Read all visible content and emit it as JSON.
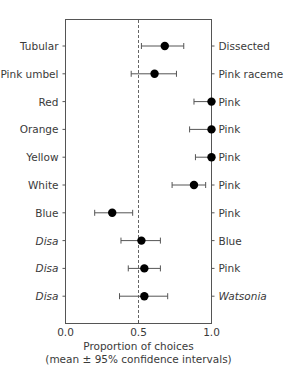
{
  "chart_data": {
    "type": "scatter",
    "subtype": "dot-plot-with-error-bars",
    "title": "",
    "xlabel": "Proportion of choices",
    "xlabel_sub": "(mean ± 95% confidence intervals)",
    "xlim": [
      0.0,
      1.0
    ],
    "xticks": [
      "0.0",
      "0.5",
      "1.0"
    ],
    "reference_line": {
      "x": 0.5,
      "style": "dashed"
    },
    "grid": false,
    "rows": [
      {
        "left": "Tubular",
        "left_italic": false,
        "right": "Dissected",
        "right_italic": false,
        "mean": 0.68,
        "ci_low": 0.52,
        "ci_high": 0.81
      },
      {
        "left": "Pink umbel",
        "left_italic": false,
        "right": "Pink raceme",
        "right_italic": false,
        "mean": 0.61,
        "ci_low": 0.45,
        "ci_high": 0.76
      },
      {
        "left": "Red",
        "left_italic": false,
        "right": "Pink",
        "right_italic": false,
        "mean": 1.0,
        "ci_low": 0.88,
        "ci_high": 1.0
      },
      {
        "left": "Orange",
        "left_italic": false,
        "right": "Pink",
        "right_italic": false,
        "mean": 1.0,
        "ci_low": 0.85,
        "ci_high": 1.0
      },
      {
        "left": "Yellow",
        "left_italic": false,
        "right": "Pink",
        "right_italic": false,
        "mean": 1.0,
        "ci_low": 0.89,
        "ci_high": 1.0
      },
      {
        "left": "White",
        "left_italic": false,
        "right": "Pink",
        "right_italic": false,
        "mean": 0.88,
        "ci_low": 0.73,
        "ci_high": 0.96
      },
      {
        "left": "Blue",
        "left_italic": false,
        "right": "Pink",
        "right_italic": false,
        "mean": 0.32,
        "ci_low": 0.2,
        "ci_high": 0.46
      },
      {
        "left": "Disa",
        "left_italic": true,
        "right": "Blue",
        "right_italic": false,
        "mean": 0.52,
        "ci_low": 0.38,
        "ci_high": 0.65
      },
      {
        "left": "Disa",
        "left_italic": true,
        "right": "Pink",
        "right_italic": false,
        "mean": 0.54,
        "ci_low": 0.43,
        "ci_high": 0.65
      },
      {
        "left": "Disa",
        "left_italic": true,
        "right": "Watsonia",
        "right_italic": true,
        "mean": 0.54,
        "ci_low": 0.37,
        "ci_high": 0.7
      }
    ]
  },
  "colors": {
    "axis": "#555555",
    "point": "#000000",
    "text": "#3a3a3a",
    "errorbar": "#555555"
  }
}
